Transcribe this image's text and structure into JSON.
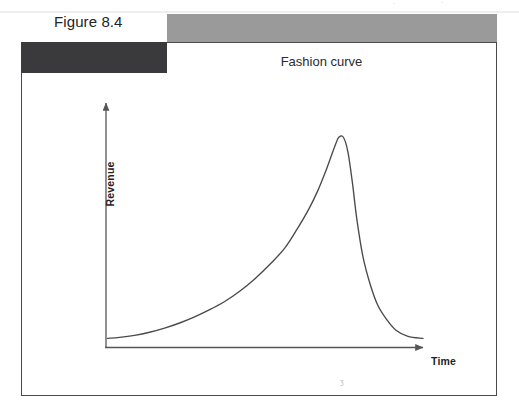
{
  "figure": {
    "label": "Figure 8.4",
    "title": "Fashion curve"
  },
  "axes": {
    "y_label": "Revenue",
    "x_label": "Time"
  },
  "colors": {
    "header_bar": "#9a9a9a",
    "header_block": "#3a3a3c",
    "frame": "#4a4a4c",
    "curve": "#4a4a4a",
    "axis": "#55555a",
    "text": "#242424"
  },
  "chart_data": {
    "type": "line",
    "title": "Fashion curve",
    "xlabel": "Time",
    "ylabel": "Revenue",
    "grid": false,
    "legend": null,
    "axis_ticks": [],
    "annotations": [],
    "series": [
      {
        "name": "Fashion curve",
        "points": [
          [
            0.0,
            0.02
          ],
          [
            0.04,
            0.025
          ],
          [
            0.09,
            0.035
          ],
          [
            0.14,
            0.05
          ],
          [
            0.19,
            0.07
          ],
          [
            0.24,
            0.095
          ],
          [
            0.29,
            0.125
          ],
          [
            0.34,
            0.16
          ],
          [
            0.39,
            0.2
          ],
          [
            0.44,
            0.25
          ],
          [
            0.49,
            0.31
          ],
          [
            0.54,
            0.38
          ],
          [
            0.59,
            0.46
          ],
          [
            0.63,
            0.55
          ],
          [
            0.67,
            0.65
          ],
          [
            0.7,
            0.74
          ],
          [
            0.725,
            0.83
          ],
          [
            0.745,
            0.91
          ],
          [
            0.76,
            0.97
          ],
          [
            0.77,
            1.0
          ],
          [
            0.785,
            1.0
          ],
          [
            0.8,
            0.93
          ],
          [
            0.815,
            0.78
          ],
          [
            0.83,
            0.6
          ],
          [
            0.85,
            0.42
          ],
          [
            0.875,
            0.28
          ],
          [
            0.9,
            0.18
          ],
          [
            0.93,
            0.11
          ],
          [
            0.96,
            0.06
          ],
          [
            1.0,
            0.03
          ],
          [
            1.05,
            0.02
          ]
        ]
      }
    ],
    "xlim": [
      0,
      1.1
    ],
    "ylim": [
      0,
      1.05
    ]
  }
}
